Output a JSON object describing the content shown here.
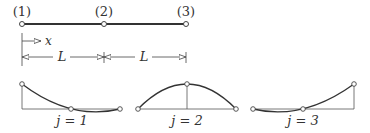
{
  "element": {
    "nodes": [
      {
        "label": "(1)",
        "x": 22
      },
      {
        "label": "(2)",
        "x": 104
      },
      {
        "label": "(3)",
        "x": 186
      }
    ],
    "axis_label": "x",
    "dimensions": [
      {
        "label": "L"
      },
      {
        "label": "L"
      }
    ]
  },
  "shape_functions": [
    {
      "label": "j = 1",
      "j": 1,
      "node_values": [
        1,
        0,
        0
      ]
    },
    {
      "label": "j = 2",
      "j": 2,
      "node_values": [
        0,
        1,
        0
      ]
    },
    {
      "label": "j = 3",
      "j": 3,
      "node_values": [
        0,
        0,
        1
      ]
    }
  ],
  "colors": {
    "line": "#333333",
    "thin": "#555555"
  }
}
